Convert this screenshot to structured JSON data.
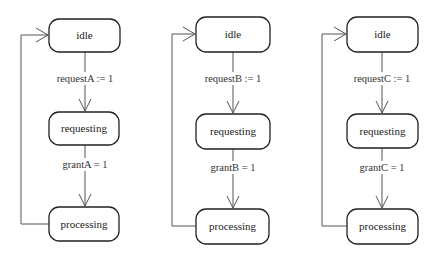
{
  "diagram": {
    "type": "state-machine",
    "machines": [
      {
        "id": "A",
        "states": [
          "idle",
          "requesting",
          "processing"
        ],
        "transitions": [
          {
            "from": "idle",
            "to": "requesting",
            "label": "requestA := 1"
          },
          {
            "from": "requesting",
            "to": "processing",
            "label": "grantA = 1"
          },
          {
            "from": "processing",
            "to": "idle",
            "label": ""
          }
        ]
      },
      {
        "id": "B",
        "states": [
          "idle",
          "requesting",
          "processing"
        ],
        "transitions": [
          {
            "from": "idle",
            "to": "requesting",
            "label": "requestB := 1"
          },
          {
            "from": "requesting",
            "to": "processing",
            "label": "grantB = 1"
          },
          {
            "from": "processing",
            "to": "idle",
            "label": ""
          }
        ]
      },
      {
        "id": "C",
        "states": [
          "idle",
          "requesting",
          "processing"
        ],
        "transitions": [
          {
            "from": "idle",
            "to": "requesting",
            "label": "requestC := 1"
          },
          {
            "from": "requesting",
            "to": "processing",
            "label": "grantC = 1"
          },
          {
            "from": "processing",
            "to": "idle",
            "label": ""
          }
        ]
      }
    ],
    "colors": {
      "stroke": "#222222",
      "edge": "#555555",
      "background": "#ffffff"
    }
  }
}
